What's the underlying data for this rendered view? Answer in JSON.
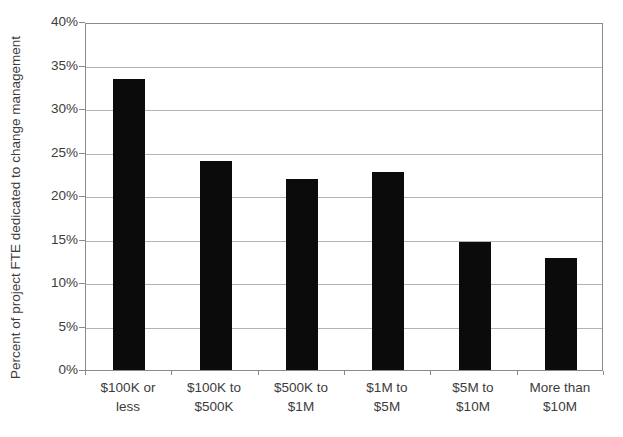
{
  "chart_data": {
    "type": "bar",
    "title": "",
    "xlabel": "",
    "ylabel": "Percent of project FTE dedicated to change management",
    "categories": [
      {
        "label": "$100K or less",
        "lines": [
          "$100K or",
          "less"
        ]
      },
      {
        "label": "$100K to $500K",
        "lines": [
          "$100K to",
          "$500K"
        ]
      },
      {
        "label": "$500K to $1M",
        "lines": [
          "$500K to",
          "$1M"
        ]
      },
      {
        "label": "$1M to $5M",
        "lines": [
          "$1M to",
          "$5M"
        ]
      },
      {
        "label": "$5M to $10M",
        "lines": [
          "$5M to",
          "$10M"
        ]
      },
      {
        "label": "More than $10M",
        "lines": [
          "More than",
          "$10M"
        ]
      }
    ],
    "values": [
      33.4,
      24.0,
      22.0,
      22.8,
      14.7,
      12.9
    ],
    "ylim": [
      0,
      40
    ],
    "ytick_step": 5,
    "ytick_labels": [
      "0%",
      "5%",
      "10%",
      "15%",
      "20%",
      "25%",
      "30%",
      "35%",
      "40%"
    ],
    "grid": true,
    "legend_position": "none",
    "colors": {
      "bar": "#0b0b0b",
      "gridline": "#b4b4b4",
      "axis": "#8a8a8a",
      "text": "#3c3c3c",
      "background": "#ffffff"
    }
  }
}
